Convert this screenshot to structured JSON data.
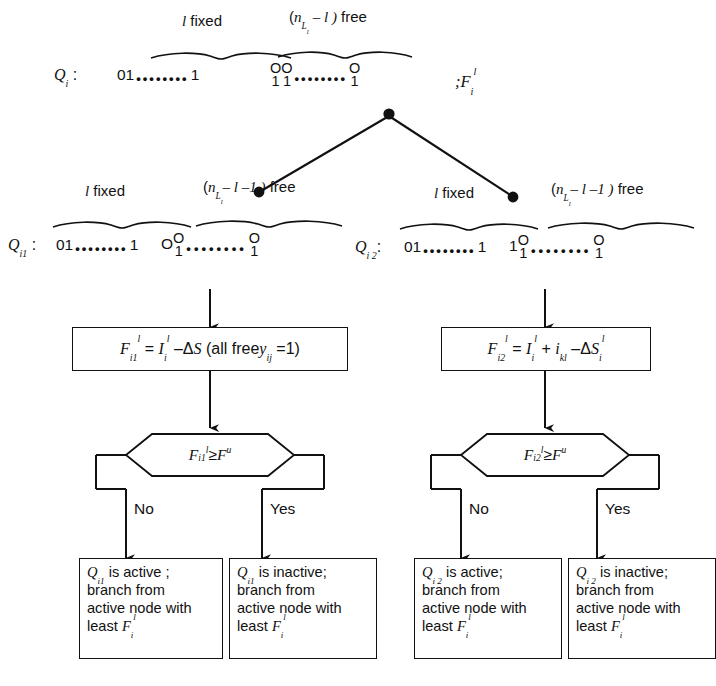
{
  "diagram": {
    "root": {
      "q_label": "Q",
      "q_sub": "i",
      "fixed_label_count": "l",
      "fixed_label_word": "fixed",
      "free_label_open": "(",
      "free_label_n": "n",
      "free_label_nsub": "L",
      "free_label_nsub2": "I",
      "free_label_expr": "– l )",
      "free_label_word": "free",
      "fixed_bits": "01",
      "fixed_bits_tail": "1",
      "free_pair_first_top": "O",
      "free_pair_first_bottom": "1",
      "free_pair_second_top": "O",
      "free_pair_second_bottom": "1",
      "free_pair_last_top": "O",
      "free_pair_last_bottom": "1",
      "f_label": ";F",
      "f_label_sub": "i",
      "f_label_sup": "l"
    },
    "left_branch": {
      "q_label": "Q",
      "q_sub": "i1",
      "fixed_label_count": "l",
      "fixed_label_word": "fixed",
      "free_label_expr": "– l –1 )",
      "free_label_word": "free",
      "fixed_bits": "01",
      "fixed_bits_tail": "1",
      "prefix_bit": "O",
      "pair_top": "O",
      "pair_bottom": "1",
      "pair_last_top": "O",
      "pair_last_bottom": "1",
      "formula": "F_i1^l = I_i^l – ΔS (all free y_ij = 1)",
      "decision": "F_i1^l ≥ F^u",
      "no_label": "No",
      "yes_label": "Yes",
      "result_no": {
        "line1_q": "Q",
        "line1_sub": "i1",
        "line1_rest": " is active ;",
        "line2": "branch from",
        "line3": "active node with",
        "line4": "least"
      },
      "result_yes": {
        "line1_q": "Q",
        "line1_sub": "i1",
        "line1_rest": " is inactive;",
        "line2": "branch   from",
        "line3": "active node with",
        "line4": "least"
      }
    },
    "right_branch": {
      "q_label": "Q",
      "q_sub": "i 2",
      "fixed_label_count": "l",
      "fixed_label_word": "fixed",
      "free_label_expr": "– l –1 )",
      "free_label_word": "free",
      "fixed_bits": "01",
      "fixed_bits_tail": "1",
      "prefix_bit": "1",
      "pair_top": "O",
      "pair_bottom": "1",
      "pair_last_top": "O",
      "pair_last_bottom": "1",
      "formula": "F_i2^l = I_i^l + i_kl – ΔS_i^l",
      "decision": "F_i2^l ≥ F^u",
      "no_label": "No",
      "yes_label": "Yes",
      "result_no": {
        "line1_q": "Q",
        "line1_sub": "i 2",
        "line1_rest": " is  active;",
        "line2": "branch  from",
        "line3": "active node with",
        "line4": "least"
      },
      "result_yes": {
        "line1_q": "Q",
        "line1_sub": "i 2",
        "line1_rest": " is inactive;",
        "line2": "branch from",
        "line3": "active node with",
        "line4": "least"
      }
    },
    "symbols": {
      "F": "F",
      "I": "I",
      "S": "S",
      "delta": "Δ",
      "geq": "≥",
      "minus": "–",
      "plus": "+",
      "eq": "=",
      "y": "y",
      "i_sub": "i",
      "l_sup": "l",
      "u_sup": "u",
      "kl_sub": "kl",
      "ij_sub": "ij",
      "one": "1",
      "two": "2",
      "all_free": "(all  free",
      "paren_close": ")",
      "dots": "••••••••"
    },
    "colors": {
      "ink": "#111111",
      "paper": "#ffffff"
    }
  }
}
